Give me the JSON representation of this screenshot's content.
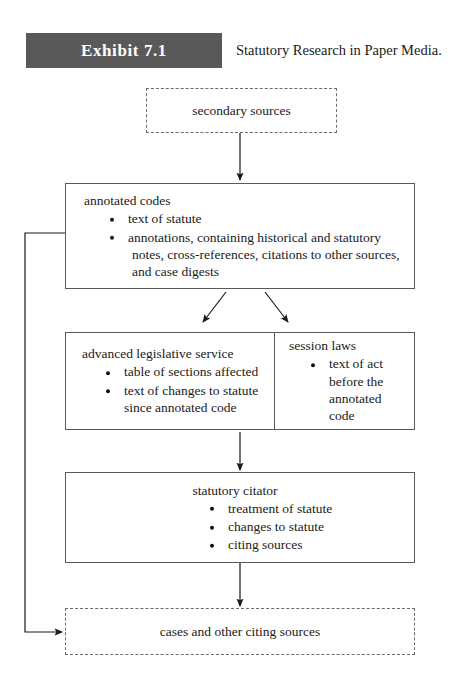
{
  "header": {
    "exhibit_label": "Exhibit 7.1",
    "title": "Statutory Research in Paper Media."
  },
  "colors": {
    "banner_bg": "#595959",
    "banner_text": "#ffffff",
    "box_border": "#5a5a5a",
    "dashed_border": "#6b6b6b",
    "text": "#1a1a1a",
    "page_bg": "#ffffff"
  },
  "diagram": {
    "type": "flowchart",
    "nodes": [
      {
        "id": "secondary-sources",
        "title": "secondary sources",
        "style": "dashed",
        "bullets": []
      },
      {
        "id": "annotated-codes",
        "title": "annotated codes",
        "style": "solid",
        "bullets": [
          {
            "text": "text of statute",
            "continuations": []
          },
          {
            "text": "annotations, containing historical and statutory",
            "continuations": [
              "notes, cross-references, citations to other sources,",
              "and case digests"
            ]
          }
        ]
      },
      {
        "id": "advanced-legislative-service",
        "title": "advanced legislative service",
        "style": "solid",
        "bullets": [
          {
            "text": "table of sections affected",
            "continuations": []
          },
          {
            "text": "text of changes to statute",
            "continuations": [
              "since annotated code"
            ]
          }
        ]
      },
      {
        "id": "session-laws",
        "title": "session laws",
        "style": "solid",
        "bullets": [
          {
            "text": "text of act",
            "continuations": [
              "before the",
              "annotated code"
            ]
          }
        ]
      },
      {
        "id": "statutory-citator",
        "title": "statutory citator",
        "style": "solid",
        "bullets": [
          {
            "text": "treatment of statute",
            "continuations": []
          },
          {
            "text": "changes to statute",
            "continuations": []
          },
          {
            "text": "citing sources",
            "continuations": []
          }
        ]
      },
      {
        "id": "cases-and-other-citing-sources",
        "title": "cases and other citing sources",
        "style": "dashed",
        "bullets": []
      }
    ],
    "connectors": [
      {
        "id": "secondary-to-annotated",
        "from": "secondary-sources",
        "to": "annotated-codes",
        "kind": "arrow-down"
      },
      {
        "id": "annotated-to-als",
        "from": "annotated-codes",
        "to": "advanced-legislative-service",
        "kind": "arrow-diagonal-left"
      },
      {
        "id": "annotated-to-session",
        "from": "annotated-codes",
        "to": "session-laws",
        "kind": "arrow-diagonal-right"
      },
      {
        "id": "als-to-citator",
        "from": "advanced-legislative-service",
        "to": "statutory-citator",
        "kind": "arrow-down"
      },
      {
        "id": "citator-to-cases",
        "from": "statutory-citator",
        "to": "cases-and-other-citing-sources",
        "kind": "arrow-down"
      },
      {
        "id": "annotated-to-cases-feedback",
        "from": "annotated-codes",
        "to": "cases-and-other-citing-sources",
        "kind": "elbow-left-arrow"
      }
    ]
  }
}
